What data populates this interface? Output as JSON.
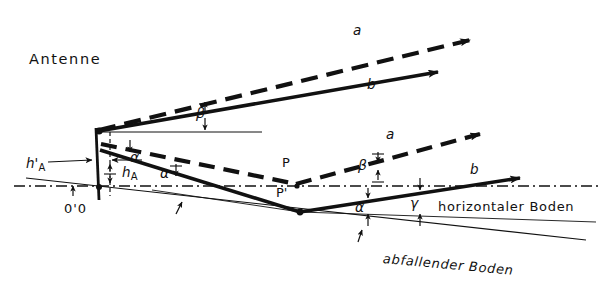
{
  "figure": {
    "title_text": "Antenne"
  },
  "labels": {
    "antenne": "Antenne",
    "horizontaler_boden": "horizontaler Boden",
    "abfallender_boden": "abfallender Boden",
    "origin": "0'0",
    "point_p": "P",
    "point_p_prime": "P'"
  },
  "rays": {
    "upper_a": "a",
    "upper_b": "b",
    "lower_a": "a",
    "lower_b": "b"
  },
  "angles": {
    "beta_upper": "β",
    "alpha_left_upper": "α",
    "alpha_left_lower": "α",
    "beta_lower": "β",
    "alpha_right": "α",
    "gamma_right": "γ"
  },
  "heights": {
    "h_a_prime_base": "h",
    "h_a_prime_mark": "'",
    "h_a_prime_sub": "A",
    "h_a_base": "h",
    "h_a_sub": "A"
  },
  "colors": {
    "ink": "#111111",
    "paper": "#ffffff",
    "thin_line": "#1a1a1a"
  },
  "line_styles": {
    "ray_a": "dashed-thick",
    "ray_b": "solid-thick",
    "horizon": "dash-dot-thin",
    "ground_slope": "solid-thin"
  }
}
